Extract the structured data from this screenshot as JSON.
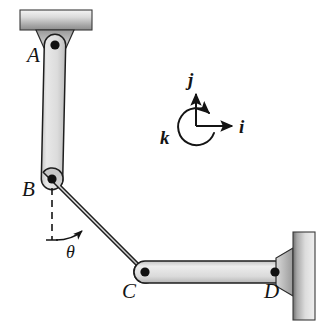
{
  "figure": {
    "background_color": "#ffffff",
    "line_color": "#141414",
    "link_fill_light": "#e6e6e6",
    "link_fill_mid": "#d2d2d2",
    "link_fill_dark": "#b4b4b4",
    "support_fill_light": "#f2f2f2",
    "support_fill_dark": "#8a8a8a",
    "pin_color": "#111111"
  },
  "joints": [
    {
      "id": "A",
      "label": "A",
      "x": 55,
      "y": 45,
      "label_x": 27,
      "label_y": 62,
      "type": "pinned-support"
    },
    {
      "id": "B",
      "label": "B",
      "x": 52,
      "y": 179,
      "label_x": 22,
      "label_y": 196,
      "type": "pin-joint"
    },
    {
      "id": "C",
      "label": "C",
      "x": 145,
      "y": 272,
      "label_x": 122,
      "label_y": 298,
      "type": "pin-joint"
    },
    {
      "id": "D",
      "label": "D",
      "x": 275,
      "y": 272,
      "label_x": 264,
      "label_y": 298,
      "type": "pinned-support"
    }
  ],
  "links": [
    {
      "id": "AB",
      "from": "A",
      "to": "B",
      "width": 22
    },
    {
      "id": "BC",
      "from": "B",
      "to": "C",
      "width": 22
    },
    {
      "id": "CD",
      "from": "C",
      "to": "D",
      "width": 22
    }
  ],
  "supports": [
    {
      "id": "top-support",
      "attached_to": "A",
      "orientation": "horizontal",
      "x": 20,
      "y": 10,
      "width": 72,
      "height": 20,
      "gradient": "light-to-dark-vertical"
    },
    {
      "id": "right-support",
      "attached_to": "D",
      "orientation": "vertical",
      "x": 293,
      "y": 232,
      "width": 22,
      "height": 88,
      "gradient": "dark-to-light-horizontal"
    }
  ],
  "angle_annotation": {
    "label": "θ",
    "label_x": 66,
    "label_y": 256,
    "vertex": "B",
    "reference_line": "vertical-dashed-downward",
    "dash_from_y": 188,
    "dash_to_y": 240,
    "arc_arrow": "counterclockwise-from-vertical-to-link-BC"
  },
  "coordinate_triad": {
    "origin_x": 196,
    "origin_y": 126,
    "axes": [
      {
        "id": "j",
        "label": "j",
        "direction": "up",
        "label_x": 190,
        "label_y": 84,
        "arrow_to_x": 196,
        "arrow_to_y": 94
      },
      {
        "id": "i",
        "label": "i",
        "direction": "right",
        "label_x": 240,
        "label_y": 133,
        "arrow_to_x": 232,
        "arrow_to_y": 126
      },
      {
        "id": "k",
        "label": "k",
        "direction": "out-of-plane-circular-arc",
        "label_x": 162,
        "label_y": 142
      }
    ]
  }
}
